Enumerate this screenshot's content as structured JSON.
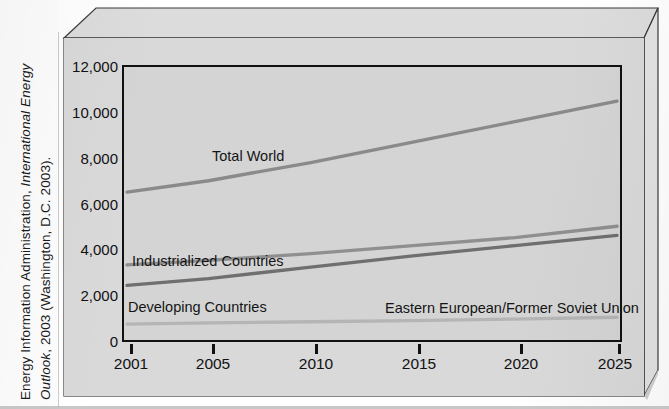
{
  "source": {
    "line1_plain_a": "Energy Information Administration, ",
    "line1_italic": "International Energy",
    "line2_italic": "Outlook",
    "line2_plain": ", 2003 (Washington, D.C. 2003)."
  },
  "colors": {
    "page_background": "#ffffff",
    "box_face": "#d9d9d9",
    "plot_background": "#d4d4d4",
    "axis": "#111111",
    "total_world_line": "#8a8a8a",
    "industrialized_line": "#8f8f8f",
    "developing_line": "#6f6f6f",
    "eastern_line": "#b5b5b5",
    "text": "#111111"
  },
  "chart_data": {
    "type": "line",
    "title": "",
    "xlabel": "",
    "ylabel": "",
    "xlim": [
      2001,
      2025
    ],
    "ylim": [
      0,
      12000
    ],
    "grid": false,
    "legend_position": "inline-labels",
    "y_ticks": [
      0,
      2000,
      4000,
      6000,
      8000,
      10000,
      12000
    ],
    "y_tick_labels": [
      "0",
      "2,000",
      "4,000",
      "6,000",
      "8,000",
      "10,000",
      "12,000"
    ],
    "y_minor_ticks": [
      1000,
      3000,
      5000,
      7000,
      9000,
      11000
    ],
    "x_ticks": [
      2001,
      2005,
      2010,
      2015,
      2020,
      2025
    ],
    "x_tick_labels": [
      "2001",
      "2005",
      "2010",
      "2015",
      "2020",
      "2025"
    ],
    "series": [
      {
        "name": "Total World",
        "label": "Total World",
        "color": "#8a8a8a",
        "x": [
          2001,
          2005,
          2010,
          2015,
          2020,
          2025
        ],
        "values": [
          6500,
          7000,
          7800,
          8700,
          9600,
          10500
        ]
      },
      {
        "name": "Industrialized Countries",
        "label": "Industrialized Countries",
        "color": "#8f8f8f",
        "x": [
          2001,
          2005,
          2010,
          2015,
          2020,
          2025
        ],
        "values": [
          3300,
          3500,
          3800,
          4150,
          4500,
          5000
        ]
      },
      {
        "name": "Developing Countries",
        "label": "Developing Countries",
        "color": "#6f6f6f",
        "x": [
          2001,
          2005,
          2010,
          2015,
          2020,
          2025
        ],
        "values": [
          2400,
          2700,
          3200,
          3700,
          4150,
          4600
        ]
      },
      {
        "name": "Eastern European/Former Soviet Union",
        "label": "Eastern European/Former Soviet Union",
        "color": "#b5b5b5",
        "x": [
          2001,
          2005,
          2010,
          2015,
          2020,
          2025
        ],
        "values": [
          700,
          750,
          800,
          850,
          920,
          1000
        ]
      }
    ]
  }
}
